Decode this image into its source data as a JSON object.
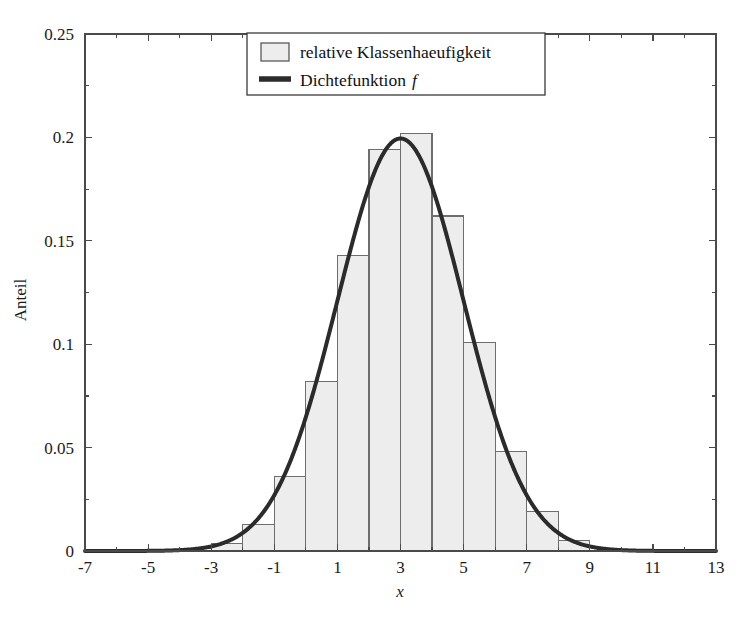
{
  "chart_data": {
    "type": "bar",
    "title": "",
    "subtitle": "",
    "xlabel": "x",
    "ylabel": "Anteil",
    "xlim": [
      -7,
      13
    ],
    "ylim": [
      0,
      0.25
    ],
    "grid": false,
    "legend_position": "top-center",
    "xticks": [
      "-7",
      "-5",
      "-3",
      "-1",
      "1",
      "3",
      "5",
      "7",
      "9",
      "11",
      "13"
    ],
    "xtick_values": [
      -7,
      -5,
      -3,
      -1,
      1,
      3,
      5,
      7,
      9,
      11,
      13
    ],
    "xminor_step": 1,
    "yticks": [
      "0",
      "0.05",
      "0.1",
      "0.15",
      "0.2",
      "0.25"
    ],
    "ytick_values": [
      0,
      0.05,
      0.1,
      0.15,
      0.2,
      0.25
    ],
    "bin_edges": [
      -4,
      -3,
      -2,
      -1,
      0,
      1,
      2,
      3,
      4,
      5,
      6,
      7,
      8,
      9
    ],
    "bin_width": 1,
    "categories": [
      "-4..-3",
      "-3..-2",
      "-2..-1",
      "-1..0",
      "0..1",
      "1..2",
      "2..3",
      "3..4",
      "4..5",
      "5..6",
      "6..7",
      "7..8",
      "8..9"
    ],
    "series": [
      {
        "name": "relative Klassenhaeufigkeit",
        "type": "bar",
        "values": [
          0.001,
          0.0035,
          0.013,
          0.036,
          0.082,
          0.143,
          0.194,
          0.202,
          0.162,
          0.101,
          0.048,
          0.019,
          0.005
        ],
        "fill_color": "#ededed",
        "edge_color": "#6e6e6e"
      },
      {
        "name": "Dichtefunktion f",
        "type": "line",
        "distribution": "normal",
        "mean": 3,
        "sigma": 2,
        "peak_value": 0.1995,
        "color": "#2b2b2b",
        "line_width": 4
      }
    ]
  },
  "axes": {
    "ylabel": "Anteil",
    "xlabel": "x",
    "xtick_labels": [
      "-7",
      "-5",
      "-3",
      "-1",
      "1",
      "3",
      "5",
      "7",
      "9",
      "11",
      "13"
    ],
    "ytick_labels": [
      "0",
      "0.05",
      "0.1",
      "0.15",
      "0.2",
      "0.25"
    ],
    "frame_color": "#4a4a4a"
  },
  "legend": {
    "items": [
      {
        "label": "relative Klassenhaeufigkeit",
        "marker": "swatch-patch",
        "italic_tail": ""
      },
      {
        "label": "Dichtefunktion",
        "marker": "line-segment",
        "italic_tail": "f"
      }
    ],
    "border_color": "#3a3a3a",
    "background": "#ffffff"
  }
}
